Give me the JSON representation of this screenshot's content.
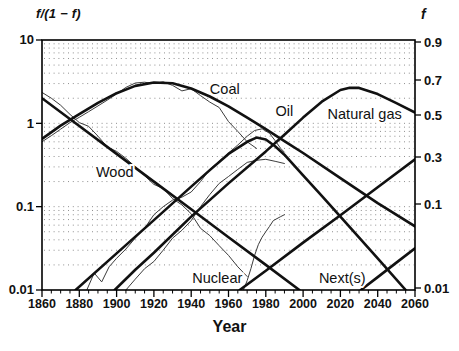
{
  "figure": {
    "left_axis_title": "f/(1 − f)",
    "right_axis_title": "f",
    "x_axis_title": "Year"
  },
  "chart_data": {
    "type": "line",
    "title": "",
    "x": {
      "label": "Year",
      "range": [
        1860,
        2060
      ],
      "major_ticks": [
        1860,
        1880,
        1900,
        1920,
        1940,
        1960,
        1980,
        2000,
        2020,
        2040,
        2060
      ],
      "minor_step": 5
    },
    "y_left": {
      "label": "f/(1 − f)",
      "scale": "log",
      "range": [
        0.01,
        10
      ],
      "ticks": [
        "10",
        "1",
        "0.1",
        "0.01"
      ]
    },
    "y_right": {
      "label": "f",
      "ticks": [
        "0.9",
        "0.7",
        "0.5",
        "0.3",
        "0.1",
        "0.01"
      ]
    },
    "grid": {
      "style": "dotted",
      "rows": "log-minor"
    },
    "legend": "none",
    "series": [
      {
        "name": "wood-model",
        "kind": "model",
        "points": [
          [
            1860,
            2.0
          ],
          [
            1880,
            0.93
          ],
          [
            1900,
            0.43
          ],
          [
            1920,
            0.2
          ],
          [
            1940,
            0.093
          ],
          [
            1960,
            0.043
          ],
          [
            1980,
            0.02
          ],
          [
            1998,
            0.01
          ]
        ]
      },
      {
        "name": "coal-model",
        "kind": "model",
        "points": [
          [
            1860,
            0.65
          ],
          [
            1870,
            0.94
          ],
          [
            1880,
            1.29
          ],
          [
            1890,
            1.76
          ],
          [
            1900,
            2.3
          ],
          [
            1910,
            2.81
          ],
          [
            1920,
            3.09
          ],
          [
            1930,
            3.02
          ],
          [
            1940,
            2.62
          ],
          [
            1950,
            2.1
          ],
          [
            1960,
            1.6
          ],
          [
            1970,
            1.17
          ],
          [
            1980,
            0.85
          ],
          [
            1990,
            0.61
          ],
          [
            2000,
            0.44
          ],
          [
            2020,
            0.22
          ],
          [
            2040,
            0.11
          ],
          [
            2060,
            0.058
          ]
        ]
      },
      {
        "name": "oil-model",
        "kind": "model",
        "points": [
          [
            1878,
            0.01
          ],
          [
            1900,
            0.0275
          ],
          [
            1920,
            0.069
          ],
          [
            1940,
            0.174
          ],
          [
            1950,
            0.275
          ],
          [
            1960,
            0.43
          ],
          [
            1970,
            0.6
          ],
          [
            1975,
            0.675
          ],
          [
            1980,
            0.64
          ],
          [
            1985,
            0.53
          ],
          [
            1990,
            0.42
          ],
          [
            2000,
            0.237
          ],
          [
            2010,
            0.135
          ],
          [
            2020,
            0.076
          ],
          [
            2040,
            0.024
          ],
          [
            2055,
            0.01
          ]
        ]
      },
      {
        "name": "natural-gas-model",
        "kind": "model",
        "points": [
          [
            1899,
            0.01
          ],
          [
            1910,
            0.0175
          ],
          [
            1920,
            0.028
          ],
          [
            1940,
            0.076
          ],
          [
            1960,
            0.19
          ],
          [
            1980,
            0.46
          ],
          [
            1990,
            0.73
          ],
          [
            2000,
            1.17
          ],
          [
            2010,
            1.82
          ],
          [
            2020,
            2.51
          ],
          [
            2025,
            2.68
          ],
          [
            2030,
            2.66
          ],
          [
            2040,
            2.24
          ],
          [
            2050,
            1.75
          ],
          [
            2060,
            1.35
          ]
        ]
      },
      {
        "name": "nuclear-model",
        "kind": "model",
        "points": [
          [
            1966,
            0.01
          ],
          [
            1980,
            0.017
          ],
          [
            2000,
            0.037
          ],
          [
            2020,
            0.079
          ],
          [
            2040,
            0.171
          ],
          [
            2060,
            0.369
          ]
        ]
      },
      {
        "name": "next-model",
        "kind": "model",
        "points": [
          [
            2031,
            0.01
          ],
          [
            2040,
            0.0143
          ],
          [
            2050,
            0.0213
          ],
          [
            2060,
            0.0316
          ]
        ]
      },
      {
        "name": "wood-historical",
        "kind": "historical",
        "points": [
          [
            1860,
            2.35
          ],
          [
            1865,
            2.0
          ],
          [
            1870,
            1.65
          ],
          [
            1875,
            1.28
          ],
          [
            1880,
            1.02
          ],
          [
            1885,
            0.92
          ],
          [
            1890,
            0.7
          ],
          [
            1895,
            0.52
          ],
          [
            1900,
            0.46
          ],
          [
            1905,
            0.38
          ],
          [
            1910,
            0.3
          ],
          [
            1915,
            0.235
          ],
          [
            1920,
            0.185
          ],
          [
            1925,
            0.165
          ],
          [
            1930,
            0.125
          ],
          [
            1935,
            0.105
          ],
          [
            1940,
            0.082
          ],
          [
            1945,
            0.055
          ],
          [
            1950,
            0.045
          ],
          [
            1955,
            0.034
          ],
          [
            1960,
            0.026
          ],
          [
            1965,
            0.019
          ],
          [
            1970,
            0.0145
          ]
        ]
      },
      {
        "name": "coal-historical",
        "kind": "historical",
        "points": [
          [
            1860,
            0.6
          ],
          [
            1865,
            0.71
          ],
          [
            1870,
            0.85
          ],
          [
            1875,
            1.02
          ],
          [
            1880,
            1.18
          ],
          [
            1885,
            1.38
          ],
          [
            1890,
            1.62
          ],
          [
            1895,
            1.9
          ],
          [
            1900,
            2.25
          ],
          [
            1905,
            2.7
          ],
          [
            1910,
            3.05
          ],
          [
            1915,
            3.12
          ],
          [
            1920,
            3.0
          ],
          [
            1925,
            3.15
          ],
          [
            1930,
            2.85
          ],
          [
            1935,
            2.45
          ],
          [
            1940,
            2.6
          ],
          [
            1945,
            2.15
          ],
          [
            1950,
            1.8
          ],
          [
            1955,
            1.55
          ],
          [
            1960,
            1.05
          ],
          [
            1965,
            0.8
          ],
          [
            1970,
            0.6
          ],
          [
            1975,
            0.5
          ]
        ]
      },
      {
        "name": "oil-historical",
        "kind": "historical",
        "points": [
          [
            1884,
            0.01
          ],
          [
            1888,
            0.016
          ],
          [
            1892,
            0.0125
          ],
          [
            1896,
            0.019
          ],
          [
            1900,
            0.024
          ],
          [
            1905,
            0.031
          ],
          [
            1910,
            0.042
          ],
          [
            1915,
            0.055
          ],
          [
            1920,
            0.08
          ],
          [
            1925,
            0.1
          ],
          [
            1930,
            0.12
          ],
          [
            1935,
            0.13
          ],
          [
            1940,
            0.15
          ],
          [
            1945,
            0.2
          ],
          [
            1950,
            0.28
          ],
          [
            1955,
            0.35
          ],
          [
            1960,
            0.44
          ],
          [
            1965,
            0.55
          ],
          [
            1970,
            0.7
          ],
          [
            1974,
            0.82
          ],
          [
            1978,
            0.86
          ],
          [
            1982,
            0.76
          ],
          [
            1985,
            0.62
          ],
          [
            1988,
            0.5
          ],
          [
            1990,
            0.45
          ]
        ]
      },
      {
        "name": "natural-gas-historical",
        "kind": "historical",
        "points": [
          [
            1905,
            0.01
          ],
          [
            1910,
            0.0135
          ],
          [
            1915,
            0.018
          ],
          [
            1920,
            0.022
          ],
          [
            1925,
            0.03
          ],
          [
            1930,
            0.042
          ],
          [
            1935,
            0.052
          ],
          [
            1940,
            0.068
          ],
          [
            1945,
            0.1
          ],
          [
            1950,
            0.14
          ],
          [
            1955,
            0.19
          ],
          [
            1960,
            0.23
          ],
          [
            1965,
            0.28
          ],
          [
            1970,
            0.34
          ],
          [
            1975,
            0.36
          ],
          [
            1980,
            0.37
          ],
          [
            1985,
            0.35
          ],
          [
            1990,
            0.33
          ]
        ]
      },
      {
        "name": "nuclear-historical",
        "kind": "historical",
        "points": [
          [
            1968,
            0.01
          ],
          [
            1970,
            0.013
          ],
          [
            1972,
            0.018
          ],
          [
            1974,
            0.026
          ],
          [
            1976,
            0.035
          ],
          [
            1978,
            0.043
          ],
          [
            1980,
            0.05
          ],
          [
            1982,
            0.058
          ],
          [
            1984,
            0.068
          ],
          [
            1986,
            0.072
          ],
          [
            1988,
            0.076
          ],
          [
            1990,
            0.08
          ]
        ]
      }
    ],
    "labels": [
      {
        "text": "Coal",
        "year": 1958,
        "value": 2.58
      },
      {
        "text": "Oil",
        "year": 1990,
        "value": 1.42
      },
      {
        "text": "Natural gas",
        "year": 2033,
        "value": 1.3
      },
      {
        "text": "Wood",
        "year": 1899,
        "value": 0.26
      },
      {
        "text": "Nuclear",
        "year": 1954,
        "value": 0.014
      },
      {
        "text": "Next(s)",
        "year": 2021,
        "value": 0.014
      }
    ],
    "colors": {
      "model": "#111111",
      "historical": "#3c3c3c",
      "grid": "#8f8f8f",
      "frame": "#000000",
      "text": "#111111",
      "background": "#ffffff"
    }
  }
}
